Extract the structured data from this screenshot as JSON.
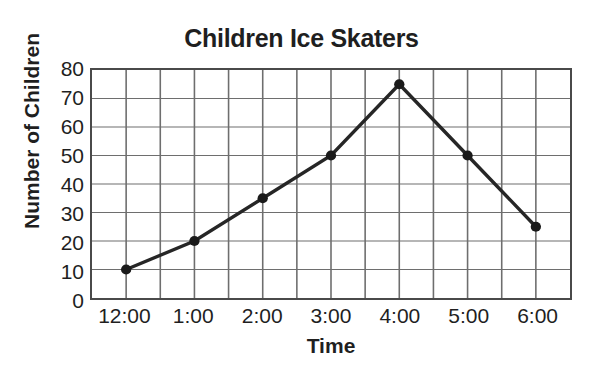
{
  "chart_data": {
    "type": "line",
    "title": "Children Ice Skaters",
    "xlabel": "Time",
    "ylabel": "Number of Children",
    "categories": [
      "12:00",
      "1:00",
      "2:00",
      "3:00",
      "4:00",
      "5:00",
      "6:00"
    ],
    "values": [
      10,
      20,
      35,
      50,
      75,
      50,
      25
    ],
    "series": [
      {
        "name": "Number of Children",
        "values": [
          10,
          20,
          35,
          50,
          75,
          50,
          25
        ]
      }
    ],
    "ylim": [
      0,
      80
    ],
    "ytick_labels": [
      "80",
      "70",
      "60",
      "50",
      "40",
      "30",
      "20",
      "10",
      "0"
    ],
    "ytick_values": [
      80,
      70,
      60,
      50,
      40,
      30,
      20,
      10,
      0
    ],
    "ytick_step": 10,
    "xtick_labels": [
      "12:00",
      "1:00",
      "2:00",
      "3:00",
      "4:00",
      "5:00",
      "6:00"
    ],
    "grid": true,
    "grid_columns": 14,
    "grid_rows": 8,
    "legend": "none",
    "marker": "filled-circle",
    "line_color": "#262626",
    "marker_color": "#1a1a1a",
    "grid_color": "#6e6e6e",
    "axis_color": "#4a4a4a",
    "background_color": "#ffffff"
  }
}
